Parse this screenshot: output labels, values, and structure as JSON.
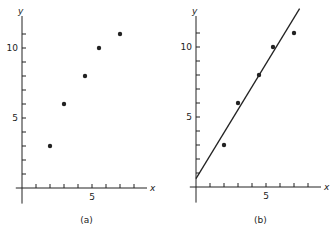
{
  "chart_data": [
    {
      "panel": "(a)",
      "type": "scatter",
      "title": "",
      "xlabel": "x",
      "ylabel": "y",
      "x": [
        2,
        3,
        4.5,
        5.5,
        7
      ],
      "y": [
        3,
        6,
        8,
        10,
        11
      ],
      "xlim": [
        -0.3,
        8.5
      ],
      "ylim": [
        -0.9,
        12.5
      ],
      "x_ticks": [
        1,
        2,
        3,
        4,
        5,
        6,
        7,
        8
      ],
      "x_tick_labels": {
        "5": "5"
      },
      "y_ticks": [
        1,
        2,
        3,
        4,
        5,
        6,
        7,
        8,
        9,
        10,
        11
      ],
      "y_tick_labels": {
        "5": "5",
        "10": "10"
      },
      "grid": false,
      "caption": "(a)"
    },
    {
      "panel": "(b)",
      "type": "scatter",
      "title": "",
      "xlabel": "x",
      "ylabel": "y",
      "x": [
        2,
        3,
        4.5,
        5.5,
        7
      ],
      "y": [
        3,
        6,
        8,
        10,
        11
      ],
      "fit_line": {
        "slope": 1.64,
        "intercept": 0.6,
        "x_range": [
          0,
          7.4
        ]
      },
      "xlim": [
        -0.3,
        8.5
      ],
      "ylim": [
        -0.9,
        12.5
      ],
      "x_ticks": [
        1,
        2,
        3,
        4,
        5,
        6,
        7,
        8
      ],
      "x_tick_labels": {
        "5": "5"
      },
      "y_ticks": [
        1,
        2,
        3,
        4,
        5,
        6,
        7,
        8,
        9,
        10,
        11
      ],
      "y_tick_labels": {
        "5": "5",
        "10": "10"
      },
      "grid": false,
      "caption": "(b)"
    }
  ],
  "panels": [
    {
      "id": "a",
      "caption": "(a)",
      "x_axis_label": "x",
      "y_axis_label": "y",
      "tick_label_5_x": "5",
      "tick_label_5_y": "5",
      "tick_label_10_y": "10"
    },
    {
      "id": "b",
      "caption": "(b)",
      "x_axis_label": "x",
      "y_axis_label": "y",
      "tick_label_5_x": "5",
      "tick_label_5_y": "5",
      "tick_label_10_y": "10"
    }
  ],
  "style": {
    "ink": "#222222",
    "background": "#ffffff"
  }
}
